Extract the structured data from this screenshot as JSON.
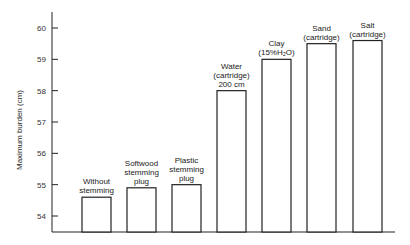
{
  "chart_data": {
    "type": "bar",
    "title": "",
    "xlabel": "",
    "ylabel": "Maximum burden (cm)",
    "ylim": [
      53.5,
      60.5
    ],
    "yticks": [
      54,
      55,
      56,
      57,
      58,
      59,
      60
    ],
    "grid": false,
    "legend": null,
    "categories": [
      [
        "Without",
        "stemming"
      ],
      [
        "Softwood",
        "stemming",
        "plug"
      ],
      [
        "Plastic",
        "stemming",
        "plug"
      ],
      [
        "Water",
        "(cartridge)",
        "200 cm"
      ],
      [
        "Clay",
        "(15%H₂O)"
      ],
      [
        "Sand",
        "(cartridge)"
      ],
      [
        "Salt",
        "(cartridge)"
      ]
    ],
    "values": [
      54.6,
      54.9,
      55.0,
      58.0,
      59.0,
      59.5,
      59.6
    ]
  }
}
